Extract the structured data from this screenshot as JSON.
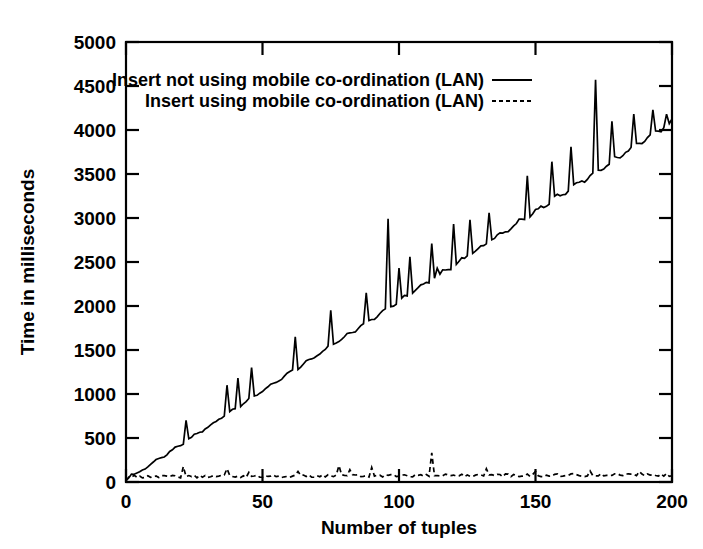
{
  "chart_data": {
    "type": "line",
    "title": "",
    "xlabel": "Number of tuples",
    "ylabel": "Time in milliseconds",
    "xlim": [
      0,
      200
    ],
    "ylim": [
      0,
      5000
    ],
    "xticks": [
      0,
      50,
      100,
      150,
      200
    ],
    "yticks": [
      0,
      500,
      1000,
      1500,
      2000,
      2500,
      3000,
      3500,
      4000,
      4500,
      5000
    ],
    "xtick_labels": [
      "0",
      "50",
      "100",
      "150",
      "200"
    ],
    "ytick_labels": [
      "0",
      "500",
      "1000",
      "1500",
      "2000",
      "2500",
      "3000",
      "3500",
      "4000",
      "4500",
      "5000"
    ],
    "grid": false,
    "legend_position": "top-left-inside",
    "series": [
      {
        "name": "Insert not using mobile co-ordination (LAN)",
        "style": "solid",
        "color": "#000000",
        "x": [
          0,
          1,
          2,
          3,
          4,
          5,
          6,
          7,
          8,
          9,
          10,
          11,
          12,
          13,
          14,
          15,
          16,
          17,
          18,
          19,
          20,
          21,
          22,
          23,
          24,
          25,
          26,
          27,
          28,
          29,
          30,
          31,
          32,
          33,
          34,
          35,
          36,
          37,
          38,
          39,
          40,
          41,
          42,
          43,
          44,
          45,
          46,
          47,
          48,
          49,
          50,
          51,
          52,
          53,
          54,
          55,
          56,
          57,
          58,
          59,
          60,
          61,
          62,
          63,
          64,
          65,
          66,
          67,
          68,
          69,
          70,
          71,
          72,
          73,
          74,
          75,
          76,
          77,
          78,
          79,
          80,
          81,
          82,
          83,
          84,
          85,
          86,
          87,
          88,
          89,
          90,
          91,
          92,
          93,
          94,
          95,
          96,
          97,
          98,
          99,
          100,
          101,
          102,
          103,
          104,
          105,
          106,
          107,
          108,
          109,
          110,
          111,
          112,
          113,
          114,
          115,
          116,
          117,
          118,
          119,
          120,
          121,
          122,
          123,
          124,
          125,
          126,
          127,
          128,
          129,
          130,
          131,
          132,
          133,
          134,
          135,
          136,
          137,
          138,
          139,
          140,
          141,
          142,
          143,
          144,
          145,
          146,
          147,
          148,
          149,
          150,
          151,
          152,
          153,
          154,
          155,
          156,
          157,
          158,
          159,
          160,
          161,
          162,
          163,
          164,
          165,
          166,
          167,
          168,
          169,
          170,
          171,
          172,
          173,
          174,
          175,
          176,
          177,
          178,
          179,
          180,
          181,
          182,
          183,
          184,
          185,
          186,
          187,
          188,
          189,
          190,
          191,
          192,
          193,
          194,
          195,
          196,
          197,
          198,
          199,
          200
        ],
        "y": [
          30,
          60,
          100,
          135,
          170,
          200,
          235,
          265,
          300,
          330,
          370,
          400,
          430,
          470,
          500,
          560,
          520,
          560,
          590,
          620,
          650,
          690,
          720,
          750,
          790,
          820,
          850,
          890,
          920,
          950,
          990,
          1020,
          1050,
          1090,
          1120,
          1150,
          1190,
          1210,
          1240,
          1270,
          1310,
          1340,
          1370,
          1400,
          1440,
          1470,
          1500,
          1530,
          1570,
          1600,
          1630,
          1660,
          1700,
          1730,
          1760,
          1800,
          1830,
          1860,
          1890,
          1930,
          1960,
          1990,
          2020,
          2060,
          2090,
          2120,
          2150,
          2190,
          2220,
          2250,
          2290,
          2320,
          2350,
          2390,
          2420,
          2450,
          2490,
          2520,
          2550,
          2590,
          2620,
          2650,
          2690,
          2720,
          2750,
          2790,
          2820,
          2850,
          2890,
          2920,
          2950,
          2990,
          3020,
          3060,
          3090,
          3120,
          3160,
          3190,
          3220,
          3260,
          3290,
          3320,
          3360,
          3390,
          3420,
          3460,
          3490,
          3520,
          3560,
          3590,
          3620,
          3660,
          3690,
          3720,
          3760,
          3790,
          3820,
          3860,
          3890,
          3920,
          3960,
          3990,
          4020,
          4060,
          4090,
          4120,
          4160,
          4190,
          4220,
          4260,
          4290,
          4320,
          4360,
          4390,
          4420,
          4460,
          4490,
          4520,
          4560,
          4590,
          4620,
          4660,
          4690,
          4720,
          4760,
          4790,
          4820,
          4860,
          4890,
          4920,
          4960,
          4990,
          5020,
          5060,
          5090,
          5120,
          5160,
          5190,
          5220,
          5260,
          5290,
          5320,
          5360,
          5390,
          5420,
          5460,
          5490,
          5520,
          5560,
          5590,
          5620,
          5660,
          5690,
          5720,
          5760,
          5790,
          5820,
          5860,
          5890,
          5920,
          5960,
          5990,
          6020,
          6060,
          6090,
          6120,
          6160,
          6190,
          6220,
          6260,
          6290,
          6320,
          6360,
          6390,
          6420,
          6460,
          6490,
          6520,
          6560,
          6590,
          6620
        ],
        "note": "approximately linear ramp from ~0 at x=0 to ~4100 at x=200 with periodic upward spikes; major spikes near x=37 (1100), x=96 (2990), x=172 (4570)"
      },
      {
        "name": "Insert using mobile co-ordination (LAN)",
        "style": "dashed",
        "color": "#000000",
        "note": "near-flat baseline around 60-110 ms across the whole range, with small spikes near x=21, x=37, x=78, x=90, x=112 (peak ~330), x=132"
      }
    ],
    "legend": [
      {
        "label": "Insert not using mobile co-ordination (LAN)",
        "style": "solid"
      },
      {
        "label": "Insert using mobile co-ordination (LAN)",
        "style": "dashed"
      }
    ]
  }
}
